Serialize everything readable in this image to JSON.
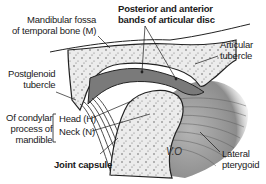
{
  "diagram": {
    "labels": {
      "mandibular_fossa_line1": "Mandibular fossa",
      "mandibular_fossa_line2": "of temporal bone (M)",
      "disc_bands_line1": "Posterior and anterior",
      "disc_bands_line2": "bands of articular disc",
      "articular_tubercle_line1": "Articular",
      "articular_tubercle_line2": "tubercle",
      "postglenoid_line1": "Postglenoid",
      "postglenoid_line2": "tubercle",
      "condylar_line1": "Of condylar",
      "condylar_line2": "process of",
      "condylar_line3": "mandible",
      "head": "Head (H)",
      "neck": "Neck (N)",
      "joint_capsule": "Joint capsule",
      "lateral_pterygoid_line1": "Lateral",
      "lateral_pterygoid_line2": "pterygoid",
      "artist_signature": "V.O"
    },
    "colors": {
      "bone": "#e9e9e9",
      "bone_speckle": "#6a6a6a",
      "disc": "#7c7c7c",
      "capsule": "#555555",
      "muscle": "#9a9a9a",
      "outline": "#222222",
      "text": "#1a1a1a"
    }
  }
}
